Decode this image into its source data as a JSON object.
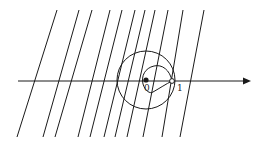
{
  "diagram": {
    "type": "complex-plane-figure",
    "axis": {
      "direction": "right",
      "arrow": true
    },
    "labels": {
      "origin": "0",
      "unit": "1"
    },
    "points": [
      {
        "name": "origin",
        "style": "filled",
        "label": "0"
      },
      {
        "name": "one",
        "style": "open",
        "label": "1"
      }
    ],
    "curves": [
      {
        "name": "large-circle",
        "kind": "circle"
      },
      {
        "name": "cardioid-loop",
        "kind": "loop"
      }
    ],
    "parallel_lines": {
      "count": 11,
      "top": [
        57,
        79,
        92,
        110,
        122,
        135,
        145,
        155,
        168,
        183,
        204
      ],
      "bottom": [
        17,
        43,
        55,
        78,
        90,
        104,
        115,
        127,
        143,
        162,
        180
      ],
      "y_top": 10,
      "y_bottom": 137
    },
    "colors": {
      "stroke": "#1a1a1a",
      "background": "#ffffff"
    }
  }
}
